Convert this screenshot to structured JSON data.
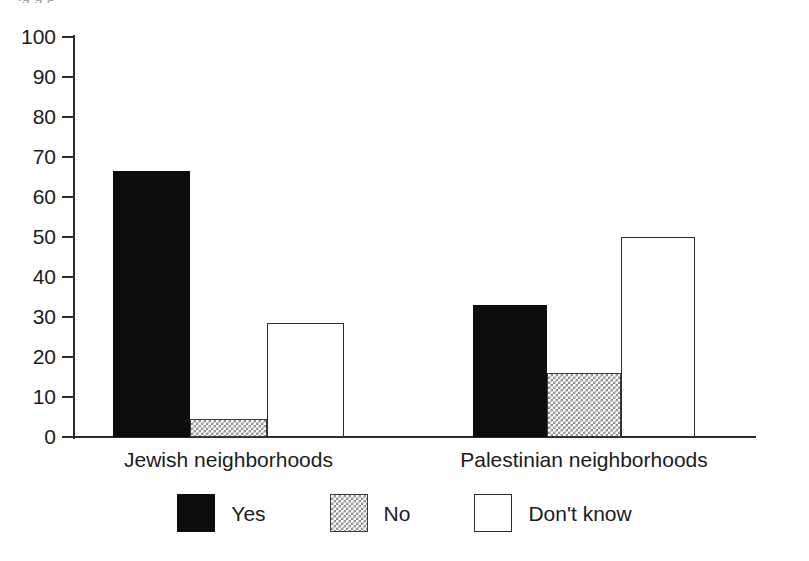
{
  "figure": {
    "cropped_top_caption": "ig                     g                    p",
    "background_color": "#ffffff"
  },
  "chart_data": {
    "type": "bar",
    "title": "",
    "subtitle": "",
    "xlabel": "",
    "ylabel": "",
    "categories": [
      "Jewish neighborhoods",
      "Palestinian neighborhoods"
    ],
    "series": [
      {
        "name": "Yes",
        "color": "#0d0d0d",
        "values": [
          66.5,
          33
        ]
      },
      {
        "name": "No",
        "color": "#8d8d8d",
        "values": [
          4.5,
          16
        ]
      },
      {
        "name": "Don't know",
        "color": "#ffffff",
        "values": [
          28.5,
          50
        ]
      }
    ],
    "ylim": [
      0,
      100
    ],
    "ytick_step": 10,
    "yticks": [
      100,
      90,
      80,
      70,
      60,
      50,
      40,
      30,
      20,
      10,
      0
    ],
    "ytick_labels": [
      "100",
      "90",
      "80",
      "70",
      "60",
      "50",
      "40",
      "30",
      "20",
      "10",
      "0"
    ],
    "grid": false,
    "legend": [
      "Yes",
      "No",
      "Don't know"
    ],
    "legend_position": "bottom-center",
    "bar_style": "grouped"
  },
  "legend": {
    "items": [
      {
        "label": "Yes",
        "swatch": "solid-black"
      },
      {
        "label": "No",
        "swatch": "hatched-gray"
      },
      {
        "label": "Don't know",
        "swatch": "outlined-white"
      }
    ]
  }
}
